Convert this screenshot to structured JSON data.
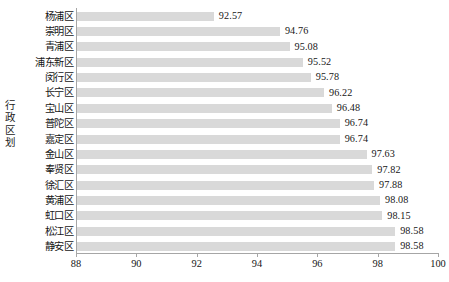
{
  "chart_data": {
    "type": "bar",
    "orientation": "horizontal",
    "title": "",
    "xlabel": "",
    "ylabel": "行政区划",
    "categories": [
      "杨浦区",
      "崇明区",
      "青浦区",
      "浦东新区",
      "闵行区",
      "长宁区",
      "宝山区",
      "普陀区",
      "嘉定区",
      "金山区",
      "奉贤区",
      "徐汇区",
      "黄浦区",
      "虹口区",
      "松江区",
      "静安区"
    ],
    "values": [
      92.57,
      94.76,
      95.08,
      95.52,
      95.78,
      96.22,
      96.48,
      96.74,
      96.74,
      97.63,
      97.82,
      97.88,
      98.08,
      98.15,
      98.58,
      98.58
    ],
    "value_labels": [
      "92.57",
      "94.76",
      "95.08",
      "95.52",
      "95.78",
      "96.22",
      "96.48",
      "96.74",
      "96.74",
      "97.63",
      "97.82",
      "97.88",
      "98.08",
      "98.15",
      "98.58",
      "98.58"
    ],
    "xlim": [
      88,
      100
    ],
    "xticks": [
      88,
      90,
      92,
      94,
      96,
      98,
      100
    ],
    "xtick_labels": [
      "88",
      "90",
      "92",
      "94",
      "96",
      "98",
      "100"
    ],
    "grid": false,
    "legend": null,
    "bar_color": "#d9d9d9",
    "axis_color": "#a6a6a6"
  },
  "caption": ""
}
